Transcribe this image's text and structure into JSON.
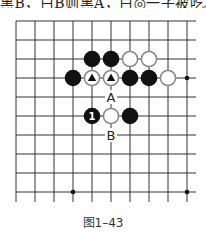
{
  "header_fragment": "黑B，白B则黑A，白◎一子被吃。",
  "caption": "图1–43",
  "board": {
    "origin_x": 16,
    "origin_y": 21,
    "spacing": 19,
    "cols": 10,
    "rows": 10,
    "line_color": "#333333",
    "star_points": [
      [
        9,
        3
      ],
      [
        3,
        9
      ],
      [
        9,
        9
      ]
    ],
    "stones": [
      {
        "col": 4,
        "row": 2,
        "color": "black"
      },
      {
        "col": 5,
        "row": 2,
        "color": "black"
      },
      {
        "col": 6,
        "row": 2,
        "color": "white"
      },
      {
        "col": 7,
        "row": 2,
        "color": "white"
      },
      {
        "col": 3,
        "row": 3,
        "color": "black"
      },
      {
        "col": 4,
        "row": 3,
        "color": "white",
        "mark": "triangle"
      },
      {
        "col": 5,
        "row": 3,
        "color": "white",
        "mark": "triangle"
      },
      {
        "col": 6,
        "row": 3,
        "color": "black"
      },
      {
        "col": 7,
        "row": 3,
        "color": "black"
      },
      {
        "col": 8,
        "row": 3,
        "color": "white"
      },
      {
        "col": 4,
        "row": 5,
        "color": "black",
        "label": "1"
      },
      {
        "col": 5,
        "row": 5,
        "color": "white"
      },
      {
        "col": 6,
        "row": 5,
        "color": "black"
      }
    ],
    "labels": [
      {
        "col": 5,
        "row": 4,
        "text": "A"
      },
      {
        "col": 5,
        "row": 6,
        "text": "B"
      }
    ]
  }
}
